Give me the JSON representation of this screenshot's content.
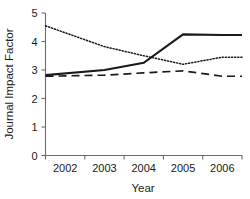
{
  "chart_data": {
    "type": "line",
    "title": "",
    "xlabel": "Year",
    "ylabel": "Journal Impact Factor",
    "categories": [
      "2002",
      "2003",
      "2004",
      "2005",
      "2006"
    ],
    "x": [
      2002,
      2003,
      2004,
      2005,
      2006
    ],
    "xlim": [
      2001.5,
      2006.5
    ],
    "ylim": [
      0,
      5
    ],
    "yticks": [
      0,
      1,
      2,
      3,
      4,
      5
    ],
    "ytick_labels": [
      "0",
      "1",
      "2",
      "3",
      "4",
      "5"
    ],
    "xtick_labels": [
      "2002",
      "2003",
      "2004",
      "2005",
      "2006"
    ],
    "grid": false,
    "legend": "none",
    "series": [
      {
        "name": "solid-series",
        "style": "solid",
        "color": "#1a1a1a",
        "values": [
          2.82,
          3.0,
          3.25,
          4.25,
          4.23
        ]
      },
      {
        "name": "dotted-series",
        "style": "dotted",
        "color": "#1a1a1a",
        "values": [
          4.55,
          3.82,
          3.5,
          3.2,
          3.45
        ]
      },
      {
        "name": "dashed-series",
        "style": "dashed",
        "color": "#1a1a1a",
        "values": [
          2.78,
          2.82,
          2.9,
          2.97,
          2.78
        ]
      }
    ]
  },
  "axes": {
    "y_title": "Journal Impact Factor",
    "x_title": "Year"
  }
}
